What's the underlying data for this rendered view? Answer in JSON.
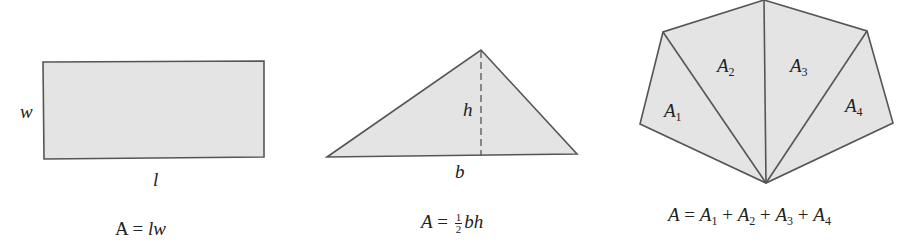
{
  "figures": [
    {
      "shape": "rectangle",
      "labels": {
        "side": "w",
        "bottom": "l"
      },
      "formula": {
        "lhs": "A",
        "eq": "=",
        "rhs": "lw"
      }
    },
    {
      "shape": "triangle",
      "labels": {
        "height": "h",
        "base": "b"
      },
      "formula": {
        "lhs": "A",
        "eq": "=",
        "frac_num": "1",
        "frac_den": "2",
        "rhs": "bh"
      }
    },
    {
      "shape": "polygon",
      "labels": {
        "regions": [
          {
            "base": "A",
            "sub": "1"
          },
          {
            "base": "A",
            "sub": "2"
          },
          {
            "base": "A",
            "sub": "3"
          },
          {
            "base": "A",
            "sub": "4"
          }
        ]
      },
      "formula": {
        "lhs": "A",
        "eq": "=",
        "terms": [
          {
            "base": "A",
            "sub": "1"
          },
          {
            "base": "A",
            "sub": "2"
          },
          {
            "base": "A",
            "sub": "3"
          },
          {
            "base": "A",
            "sub": "4"
          }
        ],
        "op": "+"
      }
    }
  ],
  "colors": {
    "fill": "#e4e4e4",
    "stroke": "#555555"
  }
}
